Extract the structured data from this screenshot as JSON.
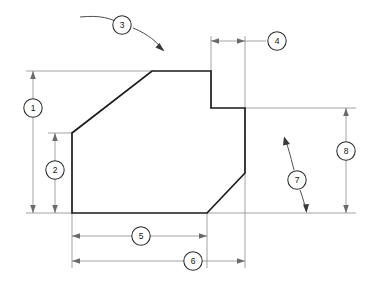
{
  "drawing": {
    "title": "Dimensioned part outline with numbered callout balloons",
    "background_color": "#ffffff",
    "outline_color": "#1a1a1a",
    "dimension_color": "#8a8a8a",
    "balloon_text_color": "#111111",
    "width": 373,
    "height": 285
  },
  "part": {
    "name": "part-outline",
    "description": "Closed polygon profile with a rectangular notch at upper right and a chamfer at lower right",
    "vertices": [
      {
        "x": 72,
        "y": 133
      },
      {
        "x": 152,
        "y": 71
      },
      {
        "x": 211,
        "y": 71
      },
      {
        "x": 211,
        "y": 108
      },
      {
        "x": 245,
        "y": 108
      },
      {
        "x": 245,
        "y": 173
      },
      {
        "x": 207,
        "y": 213
      },
      {
        "x": 72,
        "y": 213
      }
    ]
  },
  "balloons": [
    {
      "id": "1",
      "label": "1",
      "cx": 33,
      "cy": 108,
      "type": "vertical-dimension"
    },
    {
      "id": "2",
      "label": "2",
      "cx": 55,
      "cy": 170,
      "type": "vertical-dimension"
    },
    {
      "id": "3",
      "label": "3",
      "cx": 122,
      "cy": 25,
      "type": "angle-leader"
    },
    {
      "id": "4",
      "label": "4",
      "cx": 277,
      "cy": 41,
      "type": "horizontal-dimension"
    },
    {
      "id": "5",
      "label": "5",
      "cx": 141,
      "cy": 236,
      "type": "horizontal-dimension"
    },
    {
      "id": "6",
      "label": "6",
      "cx": 193,
      "cy": 261,
      "type": "horizontal-dimension"
    },
    {
      "id": "7",
      "label": "7",
      "cx": 297,
      "cy": 180,
      "type": "angle-leader"
    },
    {
      "id": "8",
      "label": "8",
      "cx": 346,
      "cy": 151,
      "type": "vertical-dimension"
    }
  ],
  "dimensions": [
    {
      "balloon": "1",
      "orientation": "vertical",
      "x": 33,
      "from": 71,
      "to": 213
    },
    {
      "balloon": "2",
      "orientation": "vertical",
      "x": 55,
      "from": 133,
      "to": 213
    },
    {
      "balloon": "4",
      "orientation": "horizontal",
      "y": 41,
      "from": 211,
      "to": 245
    },
    {
      "balloon": "5",
      "orientation": "horizontal",
      "y": 236,
      "from": 72,
      "to": 207
    },
    {
      "balloon": "6",
      "orientation": "horizontal",
      "y": 261,
      "from": 72,
      "to": 245
    },
    {
      "balloon": "8",
      "orientation": "vertical",
      "x": 346,
      "from": 108,
      "to": 213
    }
  ],
  "leaders": [
    {
      "balloon": "3",
      "from_x": 80,
      "from_y": 17,
      "to_x": 163,
      "to_y": 50,
      "target": "upper-left-diagonal-edge"
    },
    {
      "balloon": "7",
      "from_x": 285,
      "from_y": 138,
      "to_x": 306,
      "to_y": 213,
      "target": "lower-right-chamfer-edge"
    }
  ]
}
